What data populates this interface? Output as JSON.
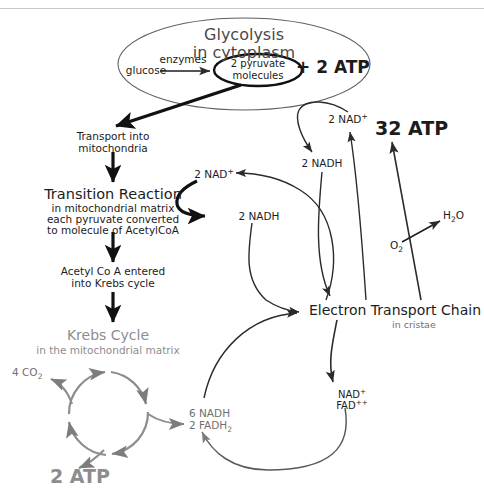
{
  "figure": {
    "colors": {
      "ink": "#1c1c1c",
      "gray": "#8d8d8d",
      "midgray": "#6f6f6f",
      "glycolysis_text": "#4a4a4a",
      "rule": "#c9c9c9",
      "background": "#ffffff"
    }
  },
  "glycolysis": {
    "title_line1": "Glycolysis",
    "title_line2": "in cytoplasm",
    "glucose": "glucose",
    "enzymes": "enzymes",
    "pyruvate_line1": "2 pyruvate",
    "pyruvate_line2": "molecules",
    "atp_yield": "+ 2 ATP"
  },
  "transport": {
    "line1": "Transport into",
    "line2": "mitochondria"
  },
  "transition": {
    "title": "Transition Reaction",
    "line1": "in mitochondrial matrix",
    "line2": "each pyruvate converted",
    "line3": "to molecule of AcetylCoA",
    "nad_plus": "2 NAD",
    "nad_plus_sup": "+",
    "nadh": "2 NADH"
  },
  "acetyl": {
    "line1": "Acetyl Co A entered",
    "line2": "into Krebs cycle"
  },
  "krebs": {
    "title": "Krebs Cycle",
    "subtitle": "in the mitochondrial matrix",
    "co2": "4 CO",
    "co2_sub": "2",
    "atp_yield": "2 ATP",
    "products_line1": "6 NADH",
    "products_line2a": "2 FADH",
    "products_line2sub": "2"
  },
  "glycolysis_nad": {
    "nad_plus": "2 NAD",
    "nad_plus_sup": "+",
    "nadh": "2 NADH"
  },
  "etc": {
    "title": "Electron Transport Chain",
    "subtitle": "in cristae",
    "atp_yield": "32 ATP",
    "oxygen": "O",
    "oxygen_sub": "2",
    "water": "H",
    "water_sub": "2",
    "water_end": "O",
    "recycled_line1": "NAD",
    "recycled_line1_sup": "+",
    "recycled_line2": "FAD",
    "recycled_line2_sup": "++"
  }
}
